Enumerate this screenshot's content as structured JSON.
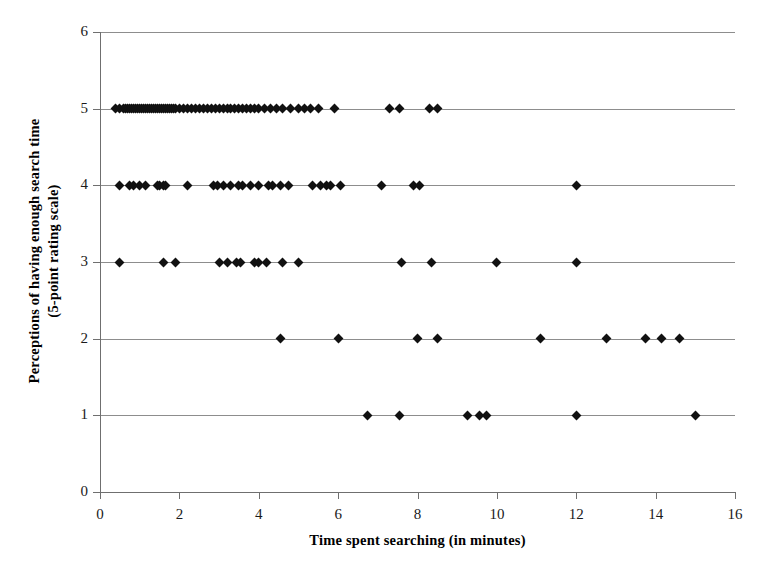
{
  "chart_data": {
    "type": "scatter",
    "title": "",
    "xlabel": "Time spent searching (in minutes)",
    "ylabel": "Perceptions of having enough search time (5-point rating scale)",
    "ylabel_line1": "Perceptions of having enough search time",
    "ylabel_line2": "(5-point rating scale)",
    "xlim": [
      0,
      16
    ],
    "ylim": [
      0,
      6
    ],
    "xticks": [
      0,
      2,
      4,
      6,
      8,
      10,
      12,
      14,
      16
    ],
    "yticks": [
      0,
      1,
      2,
      3,
      4,
      5,
      6
    ],
    "xtick_labels": [
      "0",
      "2",
      "4",
      "6",
      "8",
      "10",
      "12",
      "14",
      "16"
    ],
    "ytick_labels": [
      "0",
      "1",
      "2",
      "3",
      "4",
      "5",
      "6"
    ],
    "grid": "horizontal",
    "legend": "none",
    "marker": "diamond",
    "marker_color": "#111111",
    "gridline_color": "#8d8d8d",
    "axis_color": "#6f6f6f",
    "background": "#ffffff",
    "series": [
      {
        "name": "rating 1",
        "y": 1,
        "x": [
          6.75,
          7.55,
          9.25,
          9.55,
          9.75,
          12.0,
          15.0
        ]
      },
      {
        "name": "rating 2",
        "y": 2,
        "x": [
          4.55,
          6.0,
          8.0,
          8.5,
          11.1,
          12.75,
          13.75,
          14.15,
          14.6
        ]
      },
      {
        "name": "rating 3",
        "y": 3,
        "x": [
          0.5,
          1.6,
          1.9,
          3.0,
          3.2,
          3.45,
          3.55,
          3.9,
          4.0,
          4.2,
          4.6,
          5.0,
          7.6,
          8.35,
          10.0,
          12.0
        ]
      },
      {
        "name": "rating 4",
        "y": 4,
        "x": [
          0.5,
          0.75,
          0.85,
          1.0,
          1.15,
          1.45,
          1.5,
          1.6,
          1.65,
          2.2,
          2.85,
          2.95,
          3.1,
          3.3,
          3.5,
          3.6,
          3.8,
          4.0,
          4.25,
          4.35,
          4.55,
          4.75,
          5.35,
          5.55,
          5.7,
          5.8,
          6.05,
          7.1,
          7.9,
          8.05
        ],
        "x_extra": [
          12.0
        ]
      },
      {
        "name": "rating 5",
        "y": 5,
        "x": [
          0.4,
          0.5,
          0.6,
          0.65,
          0.7,
          0.75,
          0.8,
          0.85,
          0.9,
          0.95,
          1.0,
          1.05,
          1.1,
          1.15,
          1.2,
          1.25,
          1.3,
          1.35,
          1.4,
          1.45,
          1.5,
          1.55,
          1.6,
          1.65,
          1.7,
          1.75,
          1.8,
          1.85,
          1.9,
          2.0,
          2.1,
          2.2,
          2.3,
          2.4,
          2.5,
          2.6,
          2.7,
          2.8,
          2.9,
          3.0,
          3.1,
          3.2,
          3.3,
          3.4,
          3.5,
          3.6,
          3.7,
          3.8,
          3.9,
          4.0,
          4.15,
          4.3,
          4.45,
          4.6,
          4.8,
          5.0,
          5.15,
          5.3,
          5.5,
          5.9,
          7.3,
          7.55,
          8.3,
          8.5
        ]
      }
    ],
    "total_points": 126
  }
}
